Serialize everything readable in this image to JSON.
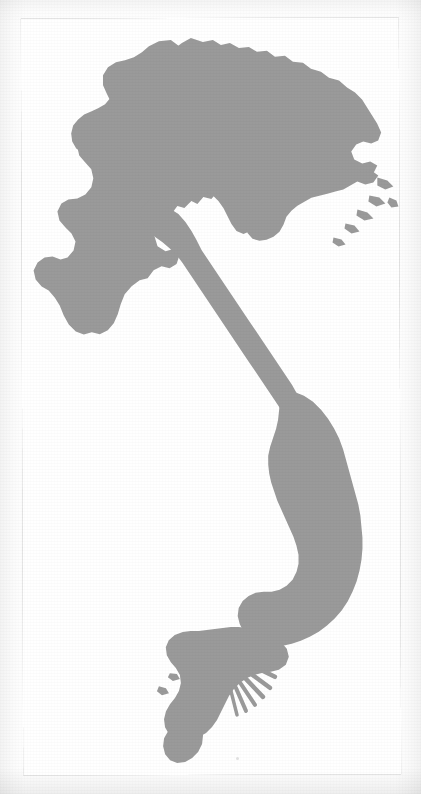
{
  "page": {
    "kind": "scanned-map-plate",
    "paper_color": "#fdfdfd",
    "inner_color": "#ffffff",
    "frame_color": "#b9b9b9",
    "frame_width_px": 1,
    "frame": {
      "x": 22,
      "y": 18,
      "width": 378,
      "height": 757
    },
    "rotation_deg": -0.18
  },
  "map": {
    "subject": "Vietnam",
    "projection_hint": "north-up outline plate",
    "land_fill": "#9a9a9a",
    "land_stroke": "none",
    "sea_fill": "#ffffff",
    "labels_present": false,
    "graticule_present": false,
    "scale_bar_present": false,
    "north_arrow_present": false,
    "features": [
      {
        "name": "northern-highlands",
        "note": "broad block forming the top of the outline"
      },
      {
        "name": "red-river-delta",
        "note": "eastern lobe below the northern block"
      },
      {
        "name": "halong-bay-islands",
        "note": "fragmented island fringe on the northeast coast"
      },
      {
        "name": "central-narrow-waist",
        "note": "slender strip running southeast"
      },
      {
        "name": "south-central-coast-bulge",
        "note": "wide eastern bulge in the south"
      },
      {
        "name": "mekong-delta",
        "note": "radiating distributary channels"
      },
      {
        "name": "ca-mau-peninsula",
        "note": "hooked southernmost tip"
      }
    ]
  },
  "artifacts": {
    "scan_speck_visible": true,
    "grain_visible": true
  }
}
